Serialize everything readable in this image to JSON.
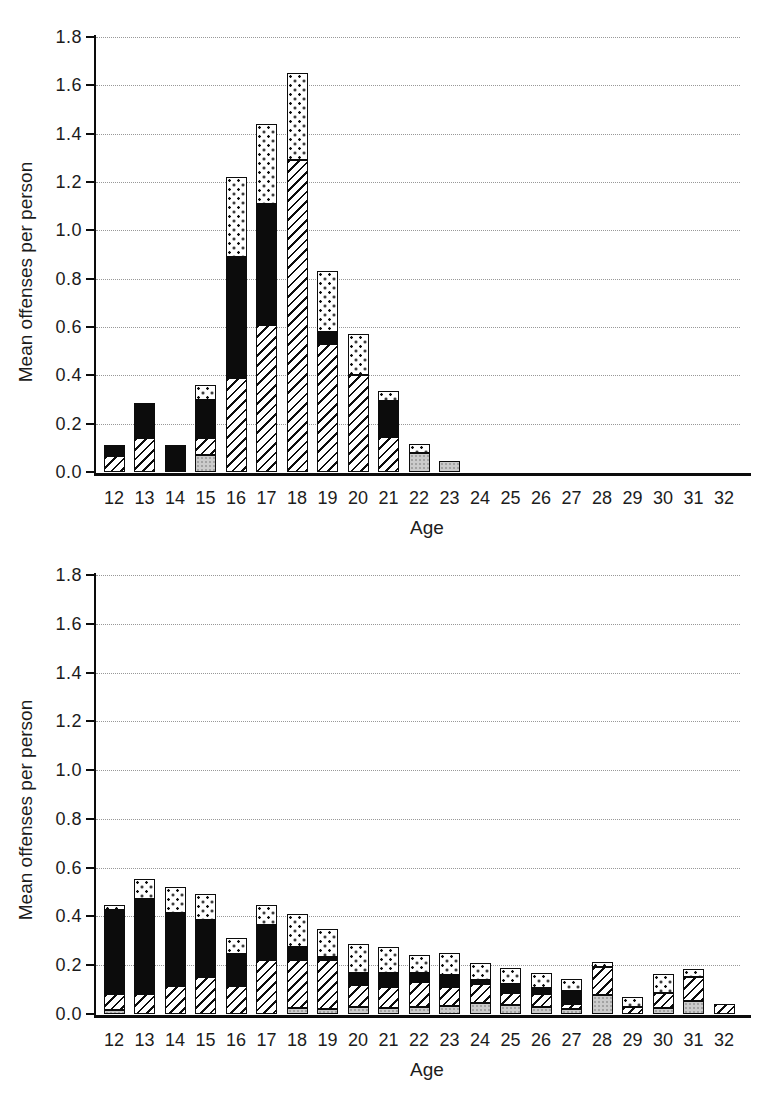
{
  "figure": {
    "background": "#ffffff",
    "text_color": "#1c1c1c",
    "axis_color": "#0c0c0c",
    "gridline_color": "#989898",
    "pattern_colors": {
      "light_gray_fill": "#cbcbcb",
      "hatch_line": "#0c0c0c",
      "solid_black": "#0c0c0c",
      "dot_color": "#0c0c0c",
      "pattern_background": "#ffffff"
    }
  },
  "chart_data": [
    {
      "type": "bar",
      "stacked": true,
      "title": "",
      "xlabel": "Age",
      "ylabel": "Mean offenses per person",
      "ylim": [
        0,
        1.8
      ],
      "grid": true,
      "legend": "none",
      "yticks": [
        "0.0",
        "0.2",
        "0.4",
        "0.6",
        "0.8",
        "1.0",
        "1.2",
        "1.4",
        "1.6",
        "1.8"
      ],
      "categories": [
        "12",
        "13",
        "14",
        "15",
        "16",
        "17",
        "18",
        "19",
        "20",
        "21",
        "22",
        "23",
        "24",
        "25",
        "26",
        "27",
        "28",
        "29",
        "30",
        "31",
        "32"
      ],
      "series": [
        {
          "name": "light-gray-stipple",
          "values": [
            0,
            0,
            0,
            0.07,
            0,
            0,
            0,
            0,
            0,
            0,
            0.08,
            0.045,
            0,
            0,
            0,
            0,
            0,
            0,
            0,
            0,
            0
          ]
        },
        {
          "name": "diagonal-hatch",
          "values": [
            0.065,
            0.14,
            0,
            0.07,
            0.39,
            0.61,
            1.29,
            0.53,
            0.4,
            0.145,
            0,
            0,
            0,
            0,
            0,
            0,
            0,
            0,
            0,
            0,
            0
          ]
        },
        {
          "name": "solid-black",
          "values": [
            0.045,
            0.145,
            0.11,
            0.16,
            0.5,
            0.5,
            0,
            0.05,
            0,
            0.15,
            0,
            0,
            0,
            0,
            0,
            0,
            0,
            0,
            0,
            0,
            0
          ]
        },
        {
          "name": "white-polka-dot",
          "values": [
            0,
            0,
            0,
            0.06,
            0.33,
            0.33,
            0.36,
            0.25,
            0.17,
            0.04,
            0.035,
            0,
            0,
            0,
            0,
            0,
            0,
            0,
            0,
            0,
            0
          ]
        }
      ]
    },
    {
      "type": "bar",
      "stacked": true,
      "title": "",
      "xlabel": "Age",
      "ylabel": "Mean offenses per person",
      "ylim": [
        0,
        1.8
      ],
      "grid": true,
      "legend": "none",
      "yticks": [
        "0.0",
        "0.2",
        "0.4",
        "0.6",
        "0.8",
        "1.0",
        "1.2",
        "1.4",
        "1.6",
        "1.8"
      ],
      "categories": [
        "12",
        "13",
        "14",
        "15",
        "16",
        "17",
        "18",
        "19",
        "20",
        "21",
        "22",
        "23",
        "24",
        "25",
        "26",
        "27",
        "28",
        "29",
        "30",
        "31",
        "32"
      ],
      "series": [
        {
          "name": "light-gray-stipple",
          "values": [
            0.015,
            0,
            0,
            0,
            0,
            0,
            0.025,
            0.02,
            0.028,
            0.025,
            0.03,
            0.033,
            0.045,
            0.035,
            0.03,
            0.022,
            0.077,
            0,
            0.023,
            0.055,
            0
          ]
        },
        {
          "name": "diagonal-hatch",
          "values": [
            0.065,
            0.08,
            0.115,
            0.15,
            0.115,
            0.22,
            0.195,
            0.2,
            0.092,
            0.087,
            0.1,
            0.077,
            0.08,
            0.05,
            0.05,
            0.02,
            0.115,
            0.03,
            0.065,
            0.095,
            0.042
          ]
        },
        {
          "name": "solid-black",
          "values": [
            0.345,
            0.39,
            0.3,
            0.235,
            0.13,
            0.145,
            0.055,
            0.015,
            0.048,
            0.056,
            0.04,
            0.05,
            0.015,
            0.04,
            0.025,
            0.053,
            0,
            0,
            0,
            0,
            0
          ]
        },
        {
          "name": "white-polka-dot",
          "values": [
            0.02,
            0.085,
            0.105,
            0.105,
            0.065,
            0.08,
            0.135,
            0.115,
            0.117,
            0.107,
            0.07,
            0.09,
            0.07,
            0.065,
            0.065,
            0.047,
            0.023,
            0.04,
            0.077,
            0.035,
            0
          ]
        }
      ]
    }
  ]
}
